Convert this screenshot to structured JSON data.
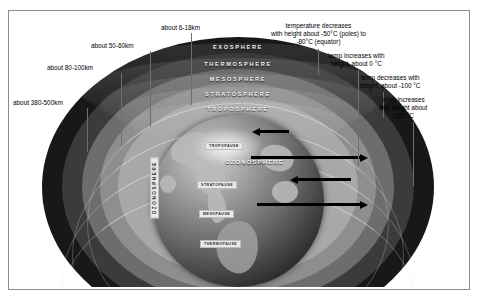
{
  "diagram": {
    "frame_border_color": "#8c8c8c",
    "background": "#ffffff"
  },
  "layers": [
    {
      "name": "EXOSPHERE",
      "color": "#181818",
      "altitude_label": "about 380-500km",
      "temp_note": "temp increases with height about 1500°C"
    },
    {
      "name": "THERMOSPHERE",
      "color": "#3b3b3b",
      "altitude_label": "about 80-100km",
      "temp_note": "temp decreases with height, about -100 °C"
    },
    {
      "name": "MESOSPHERE",
      "color": "#6d6d6d",
      "altitude_label": "about 50-60km",
      "temp_note": "temp increases with height, about 0 °C"
    },
    {
      "name": "STRATOSPHERE",
      "color": "#8e8e8e",
      "altitude_label": "about 6-18km",
      "temp_note": "temperature decreases with height about -50°C (poles) to -80°C (equator)"
    },
    {
      "name": "TROPOSPHERE",
      "color": "#a8a8a8",
      "altitude_label": "",
      "temp_note": ""
    }
  ],
  "altitude_callouts": [
    {
      "id": "exo",
      "text": "about 380-500km"
    },
    {
      "id": "thermo",
      "text": "about 80-100km"
    },
    {
      "id": "meso",
      "text": "about 50-60km"
    },
    {
      "id": "strato",
      "text": "about 6-18km"
    }
  ],
  "temperature_callouts": [
    {
      "id": "strato-temp",
      "lines": [
        "temperature decreases",
        "with height about -50°C (poles) to",
        "-80°C (equator)"
      ]
    },
    {
      "id": "meso-temp",
      "lines": [
        "temp increases with",
        "height, about 0 °C"
      ]
    },
    {
      "id": "thermo-temp",
      "lines": [
        "temp decreases with",
        "height, about -100 °C"
      ]
    },
    {
      "id": "exo-temp",
      "lines": [
        "temp increases",
        "with height about",
        "1500°C"
      ]
    }
  ],
  "boundary_labels": [
    {
      "name": "TROPOPAUSE"
    },
    {
      "name": "STRATOPAUSE"
    },
    {
      "name": "MESOPAUSE"
    },
    {
      "name": "THERMOPAUSE"
    }
  ],
  "ozone": {
    "horizontal_label": "OZONOSPHERE",
    "vertical_label": "OZONOSPHERE"
  },
  "arrows": [
    {
      "id": "arrow-1",
      "direction": "left"
    },
    {
      "id": "arrow-2",
      "direction": "right"
    },
    {
      "id": "arrow-3",
      "direction": "left"
    },
    {
      "id": "arrow-4",
      "direction": "right"
    }
  ]
}
